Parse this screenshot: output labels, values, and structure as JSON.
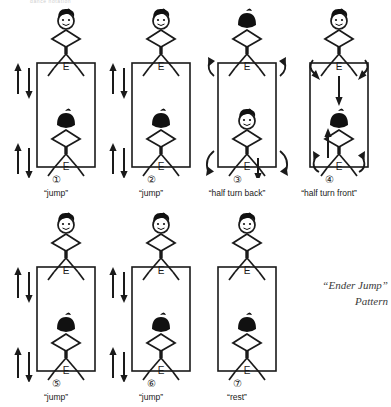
{
  "figure": {
    "title_fragment": "dance notation",
    "pattern_label": {
      "line1": "“Ender Jump”",
      "line2": "Pattern"
    },
    "foot_mark": "E",
    "colors": {
      "ink": "#1a1a1a",
      "paper": "#ffffff",
      "head_back": "#111111",
      "pattern_text": "#3a3a3a"
    },
    "panels": [
      {
        "number": "①",
        "label": "“jump”",
        "top_figure_view": "front",
        "bottom_figure_view": "back",
        "arrows": "vertical-updown-pairs",
        "arrow_count": 2
      },
      {
        "number": "②",
        "label": "“jump”",
        "top_figure_view": "front",
        "bottom_figure_view": "back",
        "arrows": "vertical-updown-pairs",
        "arrow_count": 2
      },
      {
        "number": "③",
        "label": "“half turn back”",
        "top_figure_view": "back",
        "bottom_figure_view": "front",
        "arrows": "curved-outward-plus-down",
        "arrow_count": 5
      },
      {
        "number": "④",
        "label": "“half turn front”",
        "top_figure_view": "front",
        "bottom_figure_view": "back",
        "arrows": "curved-inward-outward-plus-updown",
        "arrow_count": 6
      },
      {
        "number": "⑤",
        "label": "“jump”",
        "top_figure_view": "front",
        "bottom_figure_view": "back",
        "arrows": "vertical-updown-pairs",
        "arrow_count": 2
      },
      {
        "number": "⑥",
        "label": "“jump”",
        "top_figure_view": "front",
        "bottom_figure_view": "back",
        "arrows": "vertical-updown-pairs",
        "arrow_count": 2
      },
      {
        "number": "⑦",
        "label": "“rest”",
        "top_figure_view": "front",
        "bottom_figure_view": "back",
        "arrows": "none",
        "arrow_count": 0
      }
    ]
  }
}
